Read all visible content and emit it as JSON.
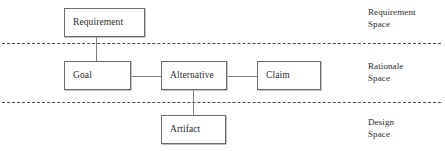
{
  "diagram": {
    "nodes": [
      {
        "id": "requirement",
        "label": "Requirement"
      },
      {
        "id": "goal",
        "label": "Goal"
      },
      {
        "id": "alternative",
        "label": "Alternative"
      },
      {
        "id": "claim",
        "label": "Claim"
      },
      {
        "id": "artifact",
        "label": "Artifact"
      }
    ],
    "spaces": [
      {
        "id": "requirement-space",
        "line1": "Requirement",
        "line2": "Space"
      },
      {
        "id": "rationale-space",
        "line1": "Rationale",
        "line2": "Space"
      },
      {
        "id": "design-space",
        "line1": "Design",
        "line2": "Space"
      }
    ],
    "connectors": [
      {
        "id": "requirement-goal",
        "from": "requirement",
        "to": "goal",
        "orientation": "vertical"
      },
      {
        "id": "goal-alternative",
        "from": "goal",
        "to": "alternative",
        "orientation": "horizontal"
      },
      {
        "id": "alternative-claim",
        "from": "alternative",
        "to": "claim",
        "orientation": "horizontal"
      },
      {
        "id": "alternative-artifact",
        "from": "alternative",
        "to": "artifact",
        "orientation": "vertical"
      }
    ],
    "style": {
      "background": "#ffffff",
      "box_border": "#6b6b6b",
      "connector_color": "#7d7d7d",
      "divider_color": "#4a4a4a",
      "text_color": "#2b2b2b"
    }
  }
}
